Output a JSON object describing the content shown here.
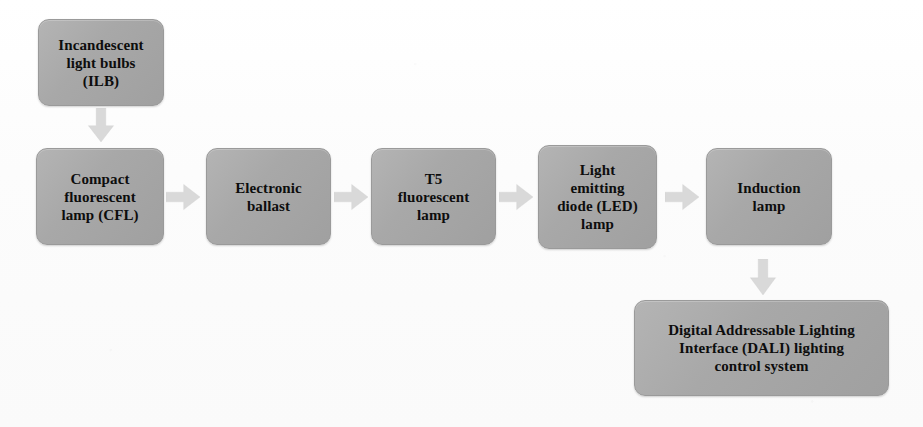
{
  "diagram": {
    "type": "flowchart",
    "background_color": "#fdfdfd",
    "node_fill_color": "#a8a8a8",
    "node_border_color": "#9a9a9a",
    "node_text_color": "#0d0d0d",
    "arrow_color": "#d9d9d9",
    "nodes": [
      {
        "id": "ilb",
        "label": "Incandescent\nlight bulbs\n(ILB)",
        "x": 38,
        "y": 19,
        "w": 126,
        "h": 87,
        "font_size": 15
      },
      {
        "id": "cfl",
        "label": "Compact\nfluorescent\nlamp (CFL)",
        "x": 36,
        "y": 148,
        "w": 128,
        "h": 97,
        "font_size": 15
      },
      {
        "id": "ballast",
        "label": "Electronic\nballast",
        "x": 206,
        "y": 148,
        "w": 125,
        "h": 97,
        "font_size": 15
      },
      {
        "id": "t5",
        "label": "T5\nfluorescent\nlamp",
        "x": 371,
        "y": 148,
        "w": 125,
        "h": 97,
        "font_size": 15
      },
      {
        "id": "led",
        "label": "Light\nemitting\ndiode (LED)\nlamp",
        "x": 538,
        "y": 145,
        "w": 119,
        "h": 104,
        "font_size": 15
      },
      {
        "id": "induction",
        "label": "Induction\nlamp",
        "x": 706,
        "y": 148,
        "w": 126,
        "h": 97,
        "font_size": 15
      },
      {
        "id": "dali",
        "label": "Digital Addressable Lighting\nInterface (DALI) lighting\ncontrol system",
        "x": 634,
        "y": 300,
        "w": 255,
        "h": 96,
        "font_size": 15
      }
    ],
    "arrows": [
      {
        "id": "ilb-to-cfl",
        "from": "ilb",
        "to": "cfl",
        "direction": "down",
        "x": 86,
        "y": 108,
        "w": 30,
        "h": 34
      },
      {
        "id": "cfl-to-ballast",
        "from": "cfl",
        "to": "ballast",
        "direction": "right",
        "x": 166,
        "y": 182,
        "w": 34,
        "h": 30
      },
      {
        "id": "ballast-to-t5",
        "from": "ballast",
        "to": "t5",
        "direction": "right",
        "x": 334,
        "y": 182,
        "w": 34,
        "h": 30
      },
      {
        "id": "t5-to-led",
        "from": "t5",
        "to": "led",
        "direction": "right",
        "x": 499,
        "y": 182,
        "w": 34,
        "h": 30
      },
      {
        "id": "led-to-induction",
        "from": "led",
        "to": "induction",
        "direction": "right",
        "x": 665,
        "y": 182,
        "w": 34,
        "h": 30
      },
      {
        "id": "induction-to-dali",
        "from": "induction",
        "to": "dali",
        "direction": "down",
        "x": 748,
        "y": 259,
        "w": 30,
        "h": 36
      }
    ]
  }
}
